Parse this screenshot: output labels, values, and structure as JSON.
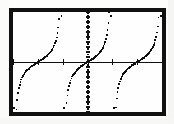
{
  "screen": {
    "device_label": "graphing-calculator-screen",
    "background_color": "#ffffff",
    "frame_color": "#111111",
    "plot_color": "#101010"
  },
  "chart_data": {
    "type": "scatter",
    "title": "",
    "subtitle": "",
    "xlabel": "",
    "ylabel": "",
    "plot_style": "dot",
    "grid": false,
    "legend": null,
    "legend_position": "none",
    "axes": {
      "x_axis_visible": true,
      "y_axis_visible": true,
      "x_axis_y_value": 0,
      "y_axis_x_value": 0,
      "x_tick_interval": 1.5707963,
      "y_tick_interval": 0.5,
      "x_tick_count": 6,
      "y_tick_count": 22
    },
    "xlim": [
      -4.712389,
      4.712389
    ],
    "ylim": [
      -5,
      5
    ],
    "series": [
      {
        "name": "y = tan(x)",
        "function": "tan",
        "marker": "dot",
        "color": "#101010",
        "asymptotes": [
          -4.712389,
          -1.570796,
          1.570796,
          4.712389
        ],
        "branches": [
          {
            "name": "branch-left-outer",
            "x_range": [
              -4.712389,
              -1.570796
            ],
            "quadrant": "upper-left-and-lower-left"
          },
          {
            "name": "branch-center",
            "x_range": [
              -1.570796,
              1.570796
            ],
            "quadrant": "through-origin"
          },
          {
            "name": "branch-right-outer",
            "x_range": [
              1.570796,
              4.712389
            ],
            "quadrant": "upper-right-and-lower-right"
          }
        ],
        "sample_points": [
          {
            "x": -4.55,
            "y": -6.4
          },
          {
            "x": -4.4,
            "y": -3.6
          },
          {
            "x": -4.25,
            "y": -2.4
          },
          {
            "x": -4.1,
            "y": -1.75
          },
          {
            "x": -3.95,
            "y": -1.35
          },
          {
            "x": -3.8,
            "y": -1.03
          },
          {
            "x": -3.6,
            "y": -0.72
          },
          {
            "x": -3.4,
            "y": -0.48
          },
          {
            "x": -3.2,
            "y": -0.26
          },
          {
            "x": -3.0,
            "y": -0.14
          },
          {
            "x": -2.8,
            "y": 0.36
          },
          {
            "x": -2.6,
            "y": 0.6
          },
          {
            "x": -2.4,
            "y": 0.82
          },
          {
            "x": -2.2,
            "y": 1.15
          },
          {
            "x": -2.0,
            "y": 1.6
          },
          {
            "x": -1.9,
            "y": 2.1
          },
          {
            "x": -1.8,
            "y": 2.9
          },
          {
            "x": -1.72,
            "y": 4.2
          },
          {
            "x": -1.66,
            "y": 6.3
          },
          {
            "x": -1.42,
            "y": -5.9
          },
          {
            "x": -1.35,
            "y": -4.2
          },
          {
            "x": -1.25,
            "y": -2.9
          },
          {
            "x": -1.15,
            "y": -2.3
          },
          {
            "x": -1.0,
            "y": -1.55
          },
          {
            "x": -0.85,
            "y": -1.15
          },
          {
            "x": -0.7,
            "y": -0.84
          },
          {
            "x": -0.5,
            "y": -0.55
          },
          {
            "x": -0.3,
            "y": -0.31
          },
          {
            "x": 0.0,
            "y": 0.0
          },
          {
            "x": 0.3,
            "y": 0.31
          },
          {
            "x": 0.5,
            "y": 0.55
          },
          {
            "x": 0.7,
            "y": 0.84
          },
          {
            "x": 0.9,
            "y": 1.26
          },
          {
            "x": 1.1,
            "y": 1.96
          },
          {
            "x": 1.25,
            "y": 3.0
          },
          {
            "x": 1.35,
            "y": 4.45
          },
          {
            "x": 1.45,
            "y": 6.4
          },
          {
            "x": 1.72,
            "y": -6.1
          },
          {
            "x": 1.8,
            "y": -4.3
          },
          {
            "x": 1.9,
            "y": -2.9
          },
          {
            "x": 2.05,
            "y": -1.85
          },
          {
            "x": 2.25,
            "y": -1.15
          },
          {
            "x": 2.5,
            "y": -0.75
          },
          {
            "x": 2.8,
            "y": -0.36
          },
          {
            "x": 3.05,
            "y": -0.09
          },
          {
            "x": 3.3,
            "y": 0.16
          },
          {
            "x": 3.6,
            "y": 0.49
          },
          {
            "x": 3.9,
            "y": 0.95
          },
          {
            "x": 4.15,
            "y": 1.6
          },
          {
            "x": 4.35,
            "y": 2.6
          },
          {
            "x": 4.5,
            "y": 4.2
          },
          {
            "x": 4.6,
            "y": 6.3
          }
        ]
      }
    ]
  }
}
